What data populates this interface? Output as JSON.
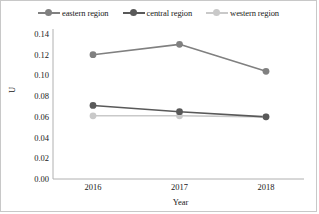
{
  "chart_data": {
    "type": "line",
    "title": "",
    "xlabel": "Year",
    "ylabel": "U",
    "categories": [
      "2016",
      "2017",
      "2018"
    ],
    "series": [
      {
        "name": "eastern region",
        "values": [
          0.12,
          0.13,
          0.104
        ],
        "color": "#808080"
      },
      {
        "name": "central region",
        "values": [
          0.071,
          0.065,
          0.06
        ],
        "color": "#595959"
      },
      {
        "name": "western region",
        "values": [
          0.061,
          0.061,
          0.06
        ],
        "color": "#c9c9c9"
      }
    ],
    "ylim": [
      0.0,
      0.14
    ],
    "ytick_labels": [
      "0.14",
      "0.12",
      "0.10",
      "0.08",
      "0.06",
      "0.04",
      "0.02",
      "0.00"
    ],
    "ytick_values": [
      0.14,
      0.12,
      0.1,
      0.08,
      0.06,
      0.04,
      0.02,
      0.0
    ],
    "grid": false,
    "legend_position": "top"
  },
  "legend": {
    "items": [
      {
        "label": "eastern region"
      },
      {
        "label": "central region"
      },
      {
        "label": "western region"
      }
    ]
  },
  "axes": {
    "y_title": "U",
    "x_title": "Year"
  },
  "colors": {
    "eastern": "#808080",
    "central": "#595959",
    "western": "#c9c9c9",
    "axis": "#b0b0b0",
    "frame": "#c8c8c8",
    "text": "#202020"
  }
}
